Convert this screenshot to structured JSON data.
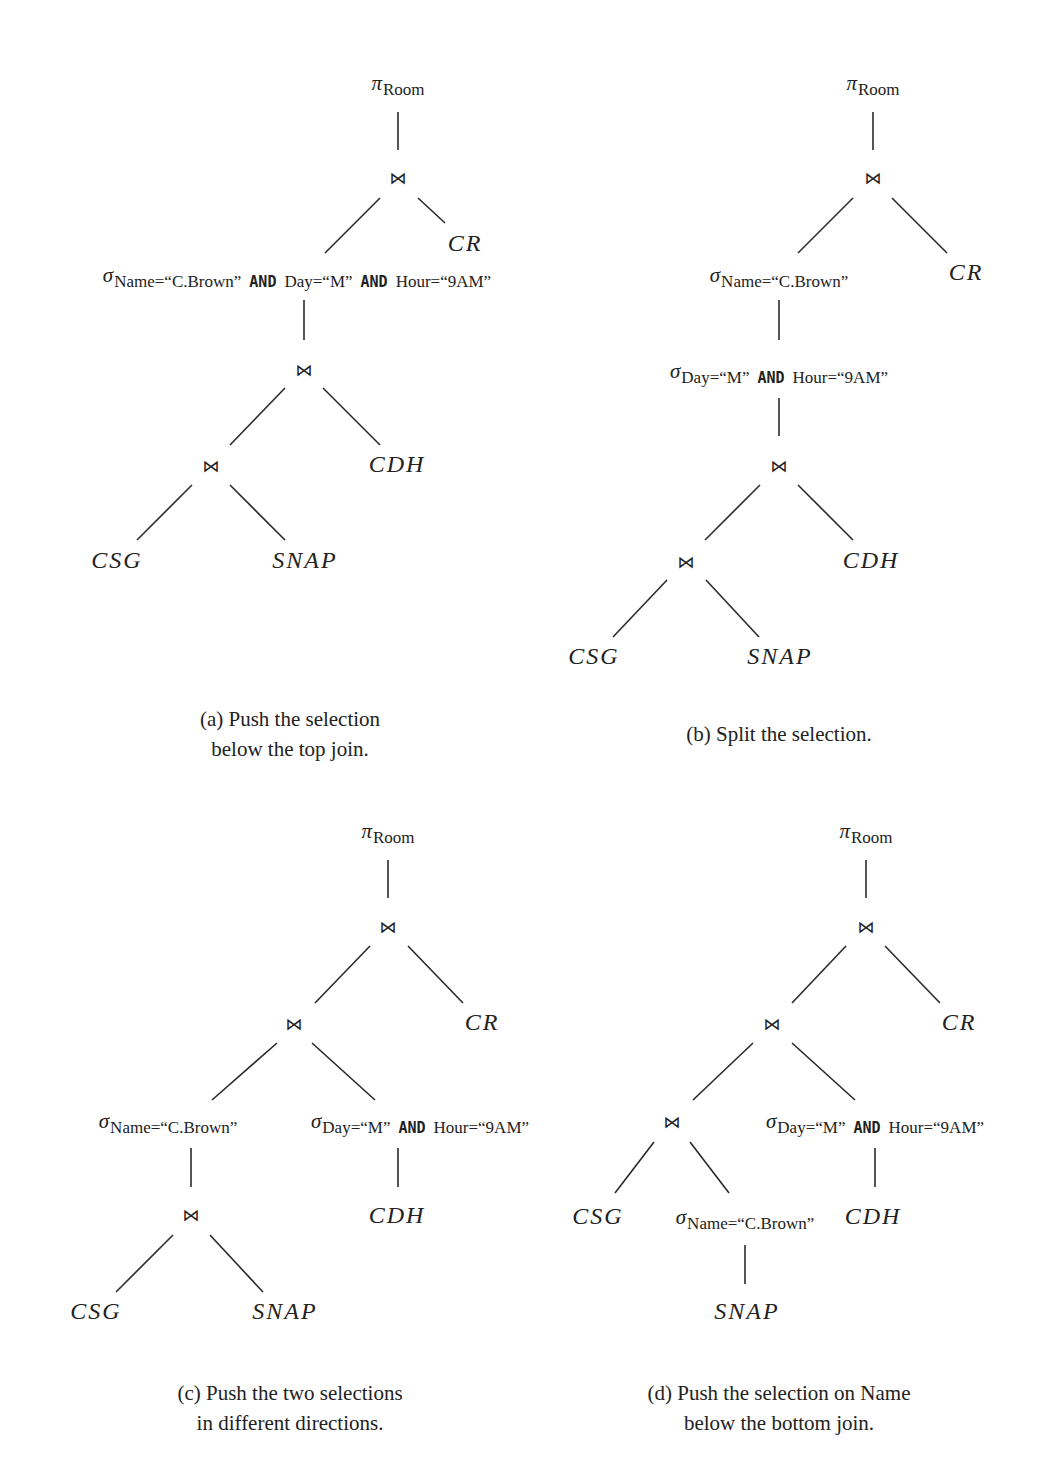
{
  "figure": {
    "symbols": {
      "projection": "π",
      "selection": "σ",
      "join": "⋈"
    },
    "panels": [
      {
        "id": "a",
        "caption_line1": "(a) Push the selection",
        "caption_line2": "below the top join.",
        "projection_attr": "Room",
        "relations": [
          "CR",
          "CDH",
          "CSG",
          "SNAP"
        ],
        "selections": [
          {
            "cond_parts": [
              "Name=“C.Brown”",
              "AND",
              "Day=“M”",
              "AND",
              "Hour=“9AM”"
            ]
          }
        ]
      },
      {
        "id": "b",
        "caption_line1": "(b) Split the selection.",
        "projection_attr": "Room",
        "relations": [
          "CR",
          "CDH",
          "CSG",
          "SNAP"
        ],
        "selections": [
          {
            "cond_parts": [
              "Name=“C.Brown”"
            ]
          },
          {
            "cond_parts": [
              "Day=“M”",
              "AND",
              "Hour=“9AM”"
            ]
          }
        ]
      },
      {
        "id": "c",
        "caption_line1": "(c) Push the two selections",
        "caption_line2": "in different directions.",
        "projection_attr": "Room",
        "relations": [
          "CR",
          "CDH",
          "CSG",
          "SNAP"
        ],
        "selections": [
          {
            "cond_parts": [
              "Name=“C.Brown”"
            ]
          },
          {
            "cond_parts": [
              "Day=“M”",
              "AND",
              "Hour=“9AM”"
            ]
          }
        ]
      },
      {
        "id": "d",
        "caption_line1": "(d) Push the selection on Name",
        "caption_line2": "below the bottom join.",
        "projection_attr": "Room",
        "relations": [
          "CR",
          "CDH",
          "CSG",
          "SNAP"
        ],
        "selections": [
          {
            "cond_parts": [
              "Day=“M”",
              "AND",
              "Hour=“9AM”"
            ]
          },
          {
            "cond_parts": [
              "Name=“C.Brown”"
            ]
          }
        ]
      }
    ]
  }
}
